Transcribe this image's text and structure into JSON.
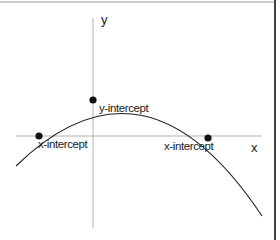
{
  "diagram": {
    "type": "parabola-graph",
    "axes": {
      "x_label": "x",
      "y_label": "y"
    },
    "points": [
      {
        "name": "x-intercept-left",
        "label": "x-intercept"
      },
      {
        "name": "y-intercept",
        "label": "y-intercept"
      },
      {
        "name": "x-intercept-right",
        "label": "x-intercept"
      }
    ],
    "colors": {
      "axis": "#b0b0b0",
      "curve": "#222222",
      "point": "#111111",
      "border": "#444444"
    }
  }
}
